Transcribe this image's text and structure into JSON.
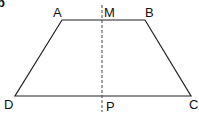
{
  "figure": {
    "part_label": "b",
    "shape": "trapezoid",
    "vertices": {
      "A": {
        "label": "A",
        "x": 62,
        "y": 20
      },
      "B": {
        "label": "B",
        "x": 145,
        "y": 20
      },
      "C": {
        "label": "C",
        "x": 191,
        "y": 96
      },
      "D": {
        "label": "D",
        "x": 15,
        "y": 96
      }
    },
    "axis_of_symmetry": {
      "top_label": "M",
      "bottom_label": "P",
      "x": 102,
      "style": "dashed"
    },
    "line_color": "#222222"
  }
}
